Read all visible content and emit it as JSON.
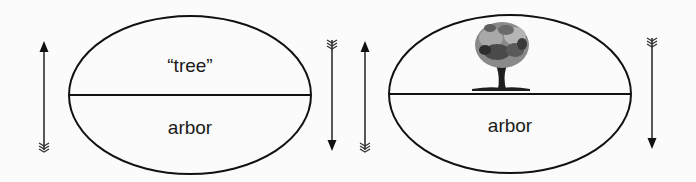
{
  "diagram": {
    "type": "saussurean-sign",
    "signs": [
      {
        "signified": "“tree”",
        "signified_kind": "text",
        "signifier": "arbor"
      },
      {
        "signified": "tree illustration",
        "signified_kind": "image",
        "signifier": "arbor"
      }
    ],
    "arrows": [
      {
        "direction": "up"
      },
      {
        "direction": "down"
      },
      {
        "direction": "up"
      },
      {
        "direction": "down"
      }
    ],
    "colors": {
      "stroke": "#111111",
      "background": "#fbfbfb",
      "tree_dark": "#2a2a2a",
      "tree_mid": "#707070",
      "tree_light": "#a8a8a8"
    }
  }
}
